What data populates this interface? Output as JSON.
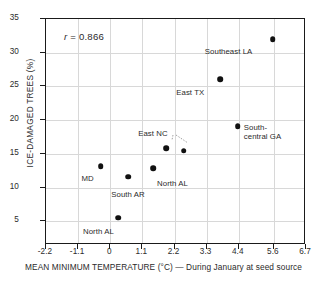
{
  "chart_data": {
    "type": "scatter",
    "title": "",
    "xlabel": "MEAN MINIMUM TEMPERATURE (°C) — During January at seed source",
    "ylabel": "ICE-DAMAGED TREES (%)",
    "xlim": [
      -2.2,
      6.7
    ],
    "ylim": [
      1.5,
      35
    ],
    "grid": true,
    "legend": "none",
    "annotation": {
      "symbol": "r",
      "equals": " = ",
      "value": "0.866",
      "full_text": "r = 0.866"
    },
    "xticks": [
      "-2.2",
      "-1.1",
      "0",
      "1.1",
      "2.2",
      "3.3",
      "4.4",
      "5.6",
      "6.7"
    ],
    "xtick_values": [
      -2.2,
      -1.1,
      0,
      1.1,
      2.2,
      3.3,
      4.4,
      5.6,
      6.7
    ],
    "yticks": [
      "5",
      "10",
      "15",
      "20",
      "25",
      "30",
      "35"
    ],
    "ytick_values": [
      5,
      10,
      15,
      20,
      25,
      30,
      35
    ],
    "points": [
      {
        "label": "Southeast LA",
        "x": 5.6,
        "y": 31.9,
        "label_dx": -68,
        "label_dy": 8
      },
      {
        "label": "East TX",
        "x": 3.8,
        "y": 25.9,
        "label_dx": -44,
        "label_dy": 9
      },
      {
        "label": "South-central GA",
        "x": 4.4,
        "y": 19.0,
        "label_dx": 6,
        "label_dy": -3
      },
      {
        "label": "East NC",
        "x": 1.95,
        "y": 15.7,
        "label_dx": -28,
        "label_dy": -19
      },
      {
        "label": "",
        "x": 2.55,
        "y": 15.3,
        "label_dx": 0,
        "label_dy": 0
      },
      {
        "label": "North AL",
        "x": 1.5,
        "y": 12.7,
        "label_dx": 4,
        "label_dy": 11
      },
      {
        "label": "MD",
        "x": -0.3,
        "y": 13.0,
        "label_dx": -19,
        "label_dy": 8
      },
      {
        "label": "South AR",
        "x": 0.65,
        "y": 11.5,
        "label_dx": -17,
        "label_dy": 13
      },
      {
        "label": "North AL",
        "x": 0.3,
        "y": 5.4,
        "label_dx": -35,
        "label_dy": 9
      }
    ],
    "colors": {
      "marker": "#111111",
      "axis": "#1a1a1a",
      "grid": "#d8d8d8",
      "text": "#2b2b2b",
      "background": "#ffffff"
    }
  }
}
